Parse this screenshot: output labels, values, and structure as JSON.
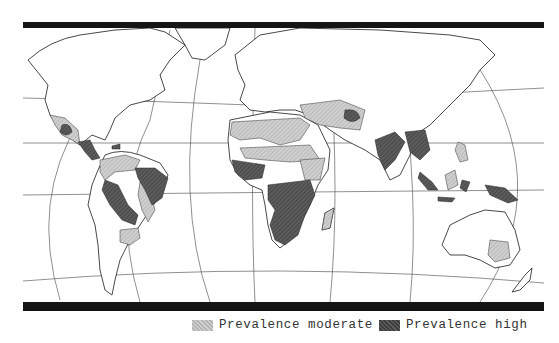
{
  "map": {
    "title": "",
    "colors": {
      "background": "#ffffff",
      "land_outline": "#1a1a1a",
      "graticule": "#444444",
      "moderate": "#c2c2c2",
      "high": "#555555",
      "bars": "#151515"
    },
    "regions": [
      {
        "name": "Mexico",
        "level": "moderate"
      },
      {
        "name": "Central America",
        "level": "high"
      },
      {
        "name": "Caribbean",
        "level": "high"
      },
      {
        "name": "Northern South America",
        "level": "moderate"
      },
      {
        "name": "Amazon / Brazil",
        "level": "high"
      },
      {
        "name": "Eastern Brazil",
        "level": "moderate"
      },
      {
        "name": "Bolivia / Peru",
        "level": "high"
      },
      {
        "name": "Paraguay / Northern Argentina",
        "level": "moderate"
      },
      {
        "name": "North Africa",
        "level": "moderate"
      },
      {
        "name": "West Africa",
        "level": "high"
      },
      {
        "name": "Sahel",
        "level": "moderate"
      },
      {
        "name": "Central & Southern Africa",
        "level": "high"
      },
      {
        "name": "East Africa",
        "level": "moderate"
      },
      {
        "name": "Madagascar",
        "level": "moderate"
      },
      {
        "name": "Middle East",
        "level": "moderate"
      },
      {
        "name": "Iran / Afghanistan",
        "level": "moderate"
      },
      {
        "name": "India",
        "level": "high"
      },
      {
        "name": "Southeast Asia",
        "level": "high"
      },
      {
        "name": "Philippines",
        "level": "moderate"
      },
      {
        "name": "Indonesia",
        "level": "high"
      },
      {
        "name": "Borneo",
        "level": "moderate"
      },
      {
        "name": "New Guinea",
        "level": "high"
      },
      {
        "name": "Eastern Australia",
        "level": "moderate"
      }
    ]
  },
  "legend": {
    "items": [
      {
        "label": "Prevalence moderate",
        "level": "moderate",
        "color": "#c2c2c2"
      },
      {
        "label": "Prevalence high",
        "level": "high",
        "color": "#555555"
      }
    ]
  }
}
